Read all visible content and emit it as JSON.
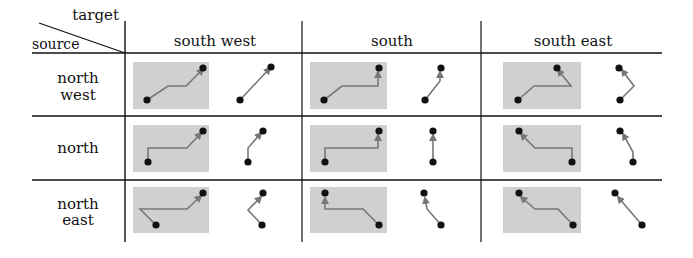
{
  "corner": {
    "target_label": "target",
    "source_label": "source"
  },
  "columns": [
    {
      "key": "sw",
      "label": "south west"
    },
    {
      "key": "s",
      "label": "south"
    },
    {
      "key": "se",
      "label": "south east"
    }
  ],
  "rows": [
    {
      "key": "nw",
      "label_line1": "north",
      "label_line2": "west"
    },
    {
      "key": "n",
      "label_line1": "north",
      "label_line2": ""
    },
    {
      "key": "ne",
      "label_line1": "north",
      "label_line2": "east"
    }
  ],
  "colors": {
    "line": "#111111",
    "box_fill": "#d0d0d0",
    "path": "#777777",
    "dot": "#111111"
  },
  "cells": [
    [
      {
        "routed": "M147,100 L168,86 L186,86 L203,69",
        "direct": "M240,100 L270,68",
        "routed_dots": [
          [
            147,
            100
          ],
          [
            203,
            68
          ]
        ],
        "direct_dots": [
          [
            240,
            100
          ],
          [
            271,
            67
          ]
        ]
      },
      {
        "routed": "M324,100 L342,86 L378,86 L378,72",
        "direct": "M425,100 L440,81 L440,72",
        "routed_dots": [
          [
            324,
            100
          ],
          [
            379,
            68
          ]
        ],
        "direct_dots": [
          [
            425,
            100
          ],
          [
            441,
            68
          ]
        ]
      },
      {
        "routed": "M518,100 L534,86 L571,86 L558,70",
        "direct": "M620,100 L634,86 L622,70",
        "routed_dots": [
          [
            518,
            100
          ],
          [
            557,
            68
          ]
        ],
        "direct_dots": [
          [
            620,
            100
          ],
          [
            619,
            68
          ]
        ]
      }
    ],
    [
      {
        "routed": "M148,162 L148,148 L187,148 L201,133",
        "direct": "M248,162 L248,148 L261,133",
        "routed_dots": [
          [
            148,
            162
          ],
          [
            203,
            131
          ]
        ],
        "direct_dots": [
          [
            248,
            162
          ],
          [
            263,
            131
          ]
        ]
      },
      {
        "routed": "M325,162 L325,148 L378,148 L378,135",
        "direct": "M433,162 L433,135",
        "routed_dots": [
          [
            325,
            162
          ],
          [
            379,
            131
          ]
        ],
        "direct_dots": [
          [
            433,
            162
          ],
          [
            433,
            131
          ]
        ]
      },
      {
        "routed": "M572,162 L572,148 L535,148 L521,134",
        "direct": "M633,162 L633,152 L623,134",
        "routed_dots": [
          [
            572,
            162
          ],
          [
            519,
            131
          ]
        ],
        "direct_dots": [
          [
            633,
            162
          ],
          [
            620,
            131
          ]
        ]
      }
    ],
    [
      {
        "routed": "M156,225 L140,209 L187,209 L201,196",
        "direct": "M262,225 L248,210 L261,197",
        "routed_dots": [
          [
            156,
            225
          ],
          [
            203,
            193
          ]
        ],
        "direct_dots": [
          [
            262,
            225
          ],
          [
            263,
            193
          ]
        ]
      },
      {
        "routed": "M379,225 L363,209 L325,209 L325,198",
        "direct": "M441,225 L427,209 L425,198",
        "routed_dots": [
          [
            379,
            225
          ],
          [
            325,
            193
          ]
        ],
        "direct_dots": [
          [
            441,
            225
          ],
          [
            424,
            193
          ]
        ]
      },
      {
        "routed": "M573,225 L558,209 L535,209 L521,197",
        "direct": "M642,225 L618,197",
        "routed_dots": [
          [
            573,
            225
          ],
          [
            519,
            193
          ]
        ],
        "direct_dots": [
          [
            642,
            225
          ],
          [
            615,
            193
          ]
        ]
      }
    ]
  ]
}
